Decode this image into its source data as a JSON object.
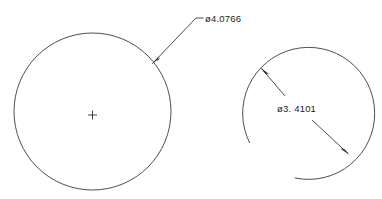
{
  "drawing": {
    "background_color": "#ffffff",
    "line_color": "#3a3a3a",
    "text_color": "#1c1c1c",
    "width": 382,
    "height": 199
  },
  "features": {
    "circle": {
      "name": "full-circle",
      "center_x": 92.5,
      "center_y": 111.5,
      "radius": 78.5,
      "center_mark": true
    },
    "arc": {
      "name": "open-arc",
      "center_x": 308,
      "center_y": 112,
      "radius": 66,
      "start_angle_deg": 152,
      "end_angle_deg": 462
    }
  },
  "dimensions": [
    {
      "id": "dim-circle-diameter",
      "label": "ø4.0766",
      "symbol": "ø",
      "value": "4.0766",
      "type": "diameter",
      "target": "full-circle",
      "text_x": 205,
      "text_y": 22,
      "leader": {
        "stub_start_x": 196,
        "stub_end_x": 203,
        "stub_y": 18,
        "elbow_x": 196,
        "elbow_y": 18,
        "arrow_x": 152,
        "arrow_y": 64
      }
    },
    {
      "id": "dim-arc-diameter",
      "label": "ø3. 4101",
      "symbol": "ø",
      "value": "3.4101",
      "type": "diameter",
      "target": "open-arc",
      "text_x": 277,
      "text_y": 109,
      "dimension_line": {
        "arrow1_x": 261,
        "arrow1_y": 68,
        "break1_x": 285,
        "break1_y": 95,
        "break2_x": 310,
        "break2_y": 118,
        "arrow2_x": 349,
        "arrow2_y": 154
      }
    }
  ]
}
